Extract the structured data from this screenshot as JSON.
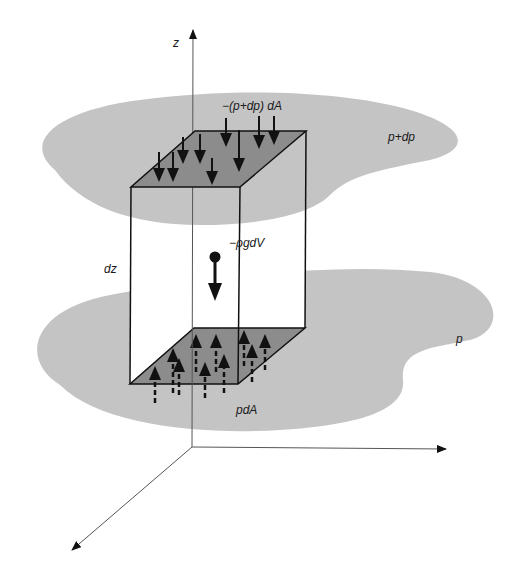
{
  "figure": {
    "type": "fluid-element-force-balance",
    "labels": {
      "z_axis": "z",
      "top_force": "−(p+dp) dA",
      "top_plane_pressure": "p+dp",
      "weight": "−ρgdV",
      "height": "dz",
      "bottom_plane_pressure": "p",
      "bottom_force": "pdA"
    },
    "colors": {
      "plane_fill": "#c4c4c4",
      "face_fill": "#8c8c8c",
      "box_side_fill": "#ffffff",
      "stroke": "#111111",
      "axis": "#555555"
    },
    "axes": {
      "origin": [
        192,
        447
      ],
      "z_end": [
        193,
        30
      ],
      "x_end": [
        446,
        449
      ],
      "y_end": [
        72,
        550
      ]
    },
    "box": {
      "top_face": [
        [
          131,
          187
        ],
        [
          240,
          187
        ],
        [
          306,
          131
        ],
        [
          195,
          131
        ]
      ],
      "bottom_face": [
        [
          130,
          384
        ],
        [
          238,
          384
        ],
        [
          305,
          328
        ],
        [
          194,
          328
        ]
      ]
    },
    "top_arrows": [],
    "bottom_arrows": [],
    "caption_faded": ""
  }
}
